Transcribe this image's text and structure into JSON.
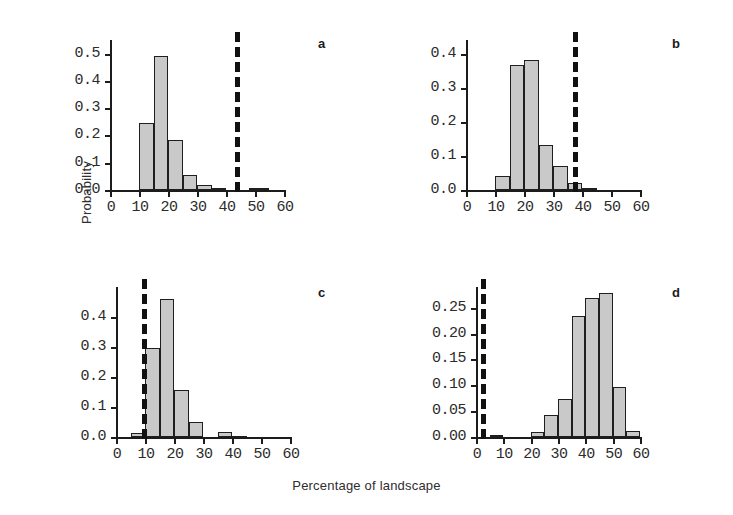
{
  "figure": {
    "xlabel": "Percentage of landscape",
    "ylabel": "Probability",
    "bar_fill": "#c9c9c9",
    "bar_stroke": "#1f1f1f",
    "refline_color": "#111111"
  },
  "chart_data": [
    {
      "type": "bar",
      "panel": "a",
      "title": "",
      "xlabel": "Percentage of landscape",
      "ylabel": "Probability",
      "xlim": [
        0,
        60
      ],
      "ylim": [
        0.0,
        0.55
      ],
      "xticks": [
        0,
        10,
        20,
        30,
        40,
        50,
        60
      ],
      "xticklabels": [
        "0",
        "10",
        "20",
        "30",
        "40",
        "50",
        "60"
      ],
      "yticks": [
        0.0,
        0.1,
        0.2,
        0.3,
        0.4,
        0.5
      ],
      "yticklabels": [
        "0.0",
        "0.1",
        "0.2",
        "0.3",
        "0.4",
        "0.5"
      ],
      "grid": false,
      "bin_width": 5,
      "bin_edges": [
        10,
        15,
        20,
        25,
        30,
        35,
        40,
        50,
        55
      ],
      "bins": [
        {
          "x0": 10,
          "x1": 15,
          "value": 0.245
        },
        {
          "x0": 15,
          "x1": 20,
          "value": 0.49
        },
        {
          "x0": 20,
          "x1": 25,
          "value": 0.185
        },
        {
          "x0": 25,
          "x1": 30,
          "value": 0.055
        },
        {
          "x0": 30,
          "x1": 35,
          "value": 0.02
        },
        {
          "x0": 35,
          "x1": 40,
          "value": 0.006
        },
        {
          "x0": 48,
          "x1": 55,
          "value": 0.008
        }
      ],
      "reference_line": {
        "x": 43,
        "style": "dashed"
      }
    },
    {
      "type": "bar",
      "panel": "b",
      "title": "",
      "xlabel": "Percentage of landscape",
      "ylabel": "Probability",
      "xlim": [
        0,
        60
      ],
      "ylim": [
        0.0,
        0.44
      ],
      "xticks": [
        0,
        10,
        20,
        30,
        40,
        50,
        60
      ],
      "xticklabels": [
        "0",
        "10",
        "20",
        "30",
        "40",
        "50",
        "60"
      ],
      "yticks": [
        0.0,
        0.1,
        0.2,
        0.3,
        0.4
      ],
      "yticklabels": [
        "0.0",
        "0.1",
        "0.2",
        "0.3",
        "0.4"
      ],
      "grid": false,
      "bin_width": 5,
      "bin_edges": [
        10,
        15,
        20,
        25,
        30,
        35,
        40,
        45
      ],
      "bins": [
        {
          "x0": 10,
          "x1": 15,
          "value": 0.04
        },
        {
          "x0": 15,
          "x1": 20,
          "value": 0.368
        },
        {
          "x0": 20,
          "x1": 25,
          "value": 0.38
        },
        {
          "x0": 25,
          "x1": 30,
          "value": 0.131
        },
        {
          "x0": 30,
          "x1": 35,
          "value": 0.07
        },
        {
          "x0": 35,
          "x1": 40,
          "value": 0.02
        },
        {
          "x0": 40,
          "x1": 45,
          "value": 0.005
        }
      ],
      "reference_line": {
        "x": 37,
        "style": "dashed"
      }
    },
    {
      "type": "bar",
      "panel": "c",
      "title": "",
      "xlabel": "Percentage of landscape",
      "ylabel": "Probability",
      "xlim": [
        0,
        60
      ],
      "ylim": [
        0.0,
        0.5
      ],
      "xticks": [
        0,
        10,
        20,
        30,
        40,
        50,
        60
      ],
      "xticklabels": [
        "0",
        "10",
        "20",
        "30",
        "40",
        "50",
        "60"
      ],
      "yticks": [
        0.0,
        0.1,
        0.2,
        0.3,
        0.4
      ],
      "yticklabels": [
        "0.0",
        "0.1",
        "0.2",
        "0.3",
        "0.4"
      ],
      "grid": false,
      "bin_width": 5,
      "bin_edges": [
        5,
        10,
        15,
        20,
        25,
        30,
        35,
        40,
        45
      ],
      "bins": [
        {
          "x0": 5,
          "x1": 10,
          "value": 0.012
        },
        {
          "x0": 10,
          "x1": 15,
          "value": 0.297
        },
        {
          "x0": 15,
          "x1": 20,
          "value": 0.46
        },
        {
          "x0": 20,
          "x1": 25,
          "value": 0.158
        },
        {
          "x0": 25,
          "x1": 30,
          "value": 0.05
        },
        {
          "x0": 35,
          "x1": 40,
          "value": 0.018
        },
        {
          "x0": 40,
          "x1": 45,
          "value": 0.005
        }
      ],
      "reference_line": {
        "x": 9,
        "style": "dashed"
      }
    },
    {
      "type": "bar",
      "panel": "d",
      "title": "",
      "xlabel": "Percentage of landscape",
      "ylabel": "Probability",
      "xlim": [
        0,
        60
      ],
      "ylim": [
        0.0,
        0.29
      ],
      "xticks": [
        0,
        10,
        20,
        30,
        40,
        50,
        60
      ],
      "xticklabels": [
        "0",
        "10",
        "20",
        "30",
        "40",
        "50",
        "60"
      ],
      "yticks": [
        0.0,
        0.05,
        0.1,
        0.15,
        0.2,
        0.25
      ],
      "yticklabels": [
        "0.00",
        "0.05",
        "0.10",
        "0.15",
        "0.20",
        "0.25"
      ],
      "grid": false,
      "bin_width": 5,
      "bin_edges": [
        5,
        10,
        20,
        25,
        30,
        35,
        40,
        45,
        50,
        55,
        60
      ],
      "bins": [
        {
          "x0": 5,
          "x1": 10,
          "value": 0.004
        },
        {
          "x0": 20,
          "x1": 25,
          "value": 0.009
        },
        {
          "x0": 25,
          "x1": 30,
          "value": 0.042
        },
        {
          "x0": 30,
          "x1": 35,
          "value": 0.074
        },
        {
          "x0": 35,
          "x1": 40,
          "value": 0.233
        },
        {
          "x0": 40,
          "x1": 45,
          "value": 0.268
        },
        {
          "x0": 45,
          "x1": 50,
          "value": 0.278
        },
        {
          "x0": 50,
          "x1": 55,
          "value": 0.096
        },
        {
          "x0": 55,
          "x1": 60,
          "value": 0.012
        }
      ],
      "reference_line": {
        "x": 2,
        "style": "dashed"
      }
    }
  ]
}
